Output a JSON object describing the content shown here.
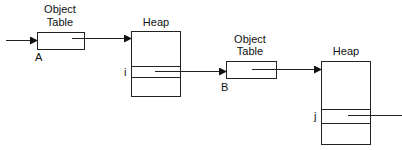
{
  "diagram": {
    "nodes": [
      {
        "id": "ot1",
        "kind": "object-table",
        "title_line1": "Object",
        "title_line2": "Table",
        "pointer_label": "A"
      },
      {
        "id": "heap1",
        "kind": "heap",
        "title": "Heap",
        "slot_label": "i"
      },
      {
        "id": "ot2",
        "kind": "object-table",
        "title_line1": "Object",
        "title_line2": "Table",
        "pointer_label": "B"
      },
      {
        "id": "heap2",
        "kind": "heap",
        "title": "Heap",
        "slot_label": "j"
      }
    ],
    "edges": [
      {
        "from": "external",
        "to": "ot1"
      },
      {
        "from": "ot1",
        "to": "heap1"
      },
      {
        "from": "heap1.slot_i",
        "to": "ot2"
      },
      {
        "from": "ot2",
        "to": "heap2"
      },
      {
        "from": "heap2.slot_j",
        "to": "external"
      }
    ]
  }
}
